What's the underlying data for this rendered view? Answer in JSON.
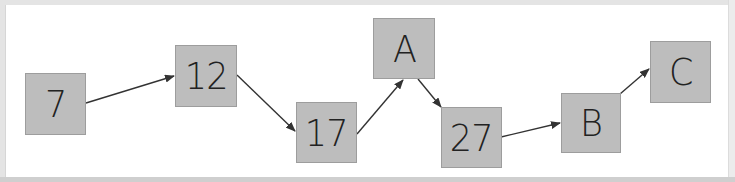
{
  "diagram": {
    "type": "flow",
    "colors": {
      "canvas": "#ffffff",
      "frame": "#e4e4e4",
      "node_fill": "#bdbdbd",
      "node_border": "#9d9d9d",
      "node_text": "#222222",
      "edge": "#333333"
    },
    "nodes": [
      {
        "id": "n7",
        "label": "7",
        "x": 25,
        "y": 73,
        "w": 61,
        "h": 62
      },
      {
        "id": "n12",
        "label": "12",
        "x": 175,
        "y": 45,
        "w": 62,
        "h": 62
      },
      {
        "id": "n17",
        "label": "17",
        "x": 296,
        "y": 102,
        "w": 61,
        "h": 61
      },
      {
        "id": "nA",
        "label": "A",
        "x": 373,
        "y": 18,
        "w": 62,
        "h": 61
      },
      {
        "id": "n27",
        "label": "27",
        "x": 441,
        "y": 107,
        "w": 61,
        "h": 61
      },
      {
        "id": "nB",
        "label": "B",
        "x": 561,
        "y": 93,
        "w": 60,
        "h": 60
      },
      {
        "id": "nC",
        "label": "C",
        "x": 650,
        "y": 41,
        "w": 61,
        "h": 62
      }
    ],
    "edges": [
      {
        "from": "7",
        "to": "12",
        "x1": 86,
        "y1": 103,
        "x2": 174,
        "y2": 76
      },
      {
        "from": "12",
        "to": "17",
        "x1": 237,
        "y1": 75,
        "x2": 295,
        "y2": 131
      },
      {
        "from": "17",
        "to": "A",
        "x1": 357,
        "y1": 134,
        "x2": 403,
        "y2": 80
      },
      {
        "from": "A",
        "to": "27",
        "x1": 418,
        "y1": 79,
        "x2": 441,
        "y2": 107
      },
      {
        "from": "27",
        "to": "B",
        "x1": 501,
        "y1": 137,
        "x2": 560,
        "y2": 123
      },
      {
        "from": "B",
        "to": "C",
        "x1": 620,
        "y1": 94,
        "x2": 649,
        "y2": 69
      }
    ]
  }
}
